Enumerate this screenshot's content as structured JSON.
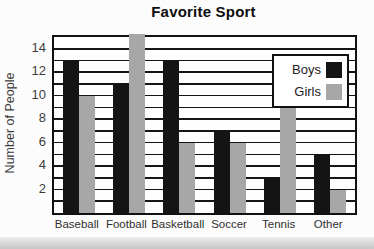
{
  "page": {
    "background": "#fcfcfc",
    "bottom_strip_color": "#c7c7c7"
  },
  "chart_data": {
    "type": "bar",
    "title": "Favorite Sport",
    "xlabel": "",
    "ylabel": "Number of People",
    "categories": [
      "Baseball",
      "Football",
      "Basketball",
      "Soccer",
      "Tennis",
      "Other"
    ],
    "series": [
      {
        "name": "Boys",
        "color": "#141414",
        "values": [
          13,
          11,
          13,
          7,
          3,
          5
        ]
      },
      {
        "name": "Girls",
        "color": "#a7a7a7",
        "values": [
          10,
          15,
          6,
          6,
          9,
          2
        ]
      }
    ],
    "ylim": [
      0,
      15
    ],
    "yticks": [
      2,
      4,
      6,
      8,
      10,
      12,
      14
    ],
    "gridline_every": 1,
    "grid": true,
    "legend_position": "top-right",
    "legend_entries": [
      "Boys",
      "Girls"
    ]
  }
}
